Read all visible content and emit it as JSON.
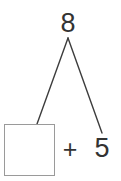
{
  "diagram": {
    "type": "number-bond-addition",
    "total": "8",
    "known_addend": "5",
    "operator": "+",
    "missing_addend": "",
    "missing_addend_placeholder": "",
    "colors": {
      "background": "#ffffff",
      "text": "#333333",
      "connector_line": "#3d3d3d",
      "box_border": "#9a9a9a",
      "box_fill": "#ffffff"
    },
    "connectors": [
      {
        "name": "left-branch",
        "from_x": 68,
        "from_y": 38,
        "to_x": 37,
        "to_y": 124
      },
      {
        "name": "right-branch",
        "from_x": 68,
        "from_y": 38,
        "to_x": 102,
        "to_y": 133
      }
    ]
  }
}
